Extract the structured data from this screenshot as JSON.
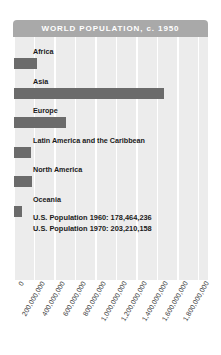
{
  "header": {
    "title": "WORLD POPULATION, c. 1950"
  },
  "annotation": {
    "line1": "U.S. Population 1960: 178,464,236",
    "line2": "U.S. Population 1970: 203,210,158"
  },
  "colors": {
    "header_bg": "#a9a9a9",
    "header_text": "#ffffff",
    "plot_bg": "#ececec",
    "gridline": "#ffffff",
    "bar": "#6b6b6b",
    "label_text": "#1a1a1a",
    "tick_text": "#3a3a3a",
    "page_bg": "#ffffff"
  },
  "chart_data": {
    "type": "bar",
    "orientation": "horizontal",
    "title": "WORLD POPULATION, c. 1950",
    "xlabel": "",
    "ylabel": "",
    "categories": [
      "Africa",
      "Asia",
      "Europe",
      "Latin America and the Caribbean",
      "North America",
      "Oceania"
    ],
    "values": [
      228000000,
      1460000000,
      510000000,
      168000000,
      172000000,
      82000000
    ],
    "xlim": [
      0,
      1900000000
    ],
    "ticks": [
      "0",
      "200,000,000",
      "400,000,000",
      "600,000,000",
      "800,000,000",
      "1,000,000,000",
      "1,200,000,000",
      "1,400,000,000",
      "1,600,000,000",
      "1,800,000,000"
    ],
    "tick_values": [
      0,
      200000000,
      400000000,
      600000000,
      800000000,
      1000000000,
      1200000000,
      1400000000,
      1600000000,
      1800000000
    ],
    "grid": true,
    "legend": "none",
    "annotations": [
      "U.S. Population 1960: 178,464,236",
      "U.S. Population 1970: 203,210,158"
    ]
  }
}
